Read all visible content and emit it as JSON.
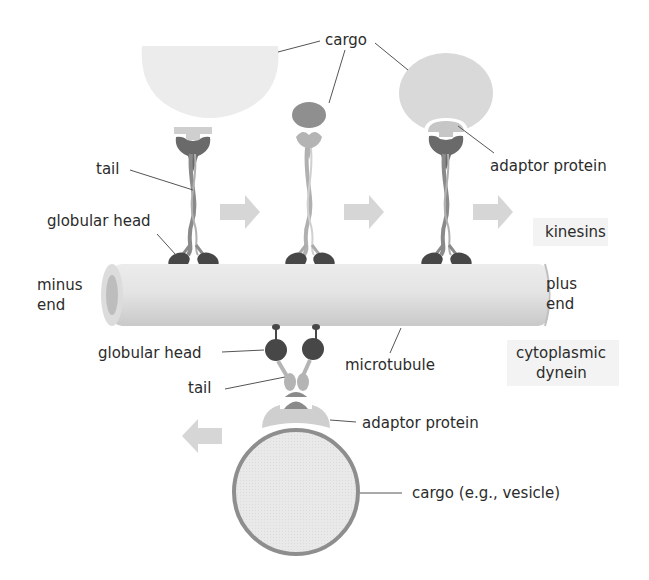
{
  "figure": {
    "colors": {
      "cargo_light": "#ececec",
      "cargo_medium": "#d6d6d6",
      "cargo_dark": "#8e8e8e",
      "motor_dark": "#4a4a4a",
      "motor_medium": "#7a7a7a",
      "motor_light": "#b8b8b8",
      "adaptor": "#cfcfcf",
      "microtubule": "#e2e2e2",
      "arrow": "#d2d2d2",
      "vesicle_border": "#8a8a8a",
      "group_box": "#f2f2f2"
    }
  },
  "labels": {
    "cargo_top": "cargo",
    "tail_top": "tail",
    "globular_head_top": "globular head",
    "adaptor_protein_top": "adaptor protein",
    "kinesins": "kinesins",
    "minus_end_1": "minus",
    "minus_end_2": "end",
    "plus_end_1": "plus",
    "plus_end_2": "end",
    "globular_head_bottom": "globular head",
    "microtubule": "microtubule",
    "cytoplasmic_dynein_1": "cytoplasmic",
    "cytoplasmic_dynein_2": "dynein",
    "tail_bottom": "tail",
    "adaptor_protein_bottom": "adaptor protein",
    "cargo_bottom": "cargo (e.g., vesicle)"
  },
  "motion": {
    "kinesin_direction": "toward plus end",
    "dynein_direction": "toward minus end"
  }
}
